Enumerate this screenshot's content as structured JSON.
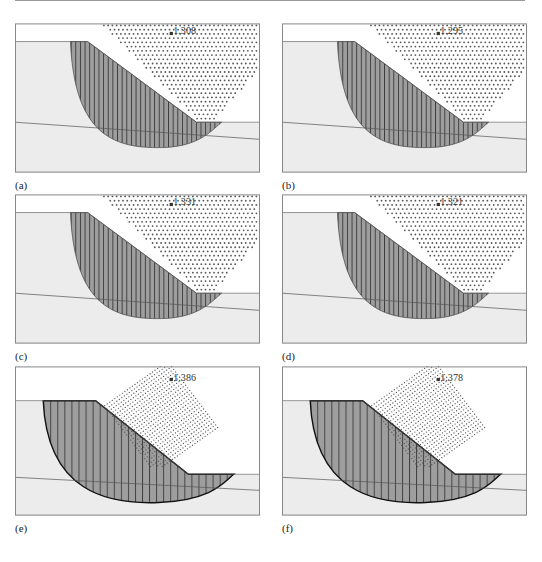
{
  "figure": {
    "panels": [
      {
        "id": "a",
        "caption": "(a)",
        "fos": "1.308",
        "variant": "small"
      },
      {
        "id": "b",
        "caption": "(b)",
        "fos": "1.295",
        "variant": "small"
      },
      {
        "id": "c",
        "caption": "(c)",
        "fos": "1.331",
        "variant": "small"
      },
      {
        "id": "d",
        "caption": "(d)",
        "fos": "1.321",
        "variant": "small"
      },
      {
        "id": "e",
        "caption": "(e)",
        "fos": "1.386",
        "variant": "large"
      },
      {
        "id": "f",
        "caption": "(f)",
        "fos": "1.378",
        "variant": "large"
      }
    ],
    "colors": {
      "soil": "#ececec",
      "slip_mass": "#9e9e9e",
      "hatch": "#2a2a2a",
      "grid_dots": "#555555",
      "frame": "#888888",
      "boundary": "#555555"
    }
  }
}
